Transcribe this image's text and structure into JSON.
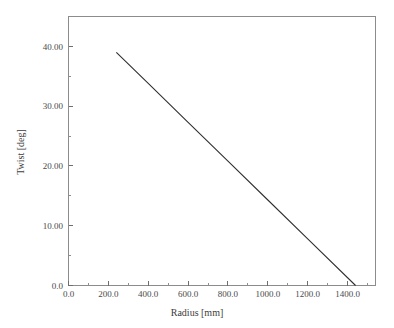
{
  "chart_data": {
    "type": "line",
    "title": "",
    "xlabel": "Radius [mm]",
    "ylabel": "Twist [deg]",
    "xlim": [
      0,
      1540
    ],
    "ylim": [
      0,
      45
    ],
    "grid": false,
    "legend": "none",
    "line_color": "#2f2f2f",
    "frame_color": "#8c8c8c",
    "x_ticks": [
      {
        "value": 0,
        "label": "0.0"
      },
      {
        "value": 200,
        "label": "200.0"
      },
      {
        "value": 400,
        "label": "400.0"
      },
      {
        "value": 600,
        "label": "600.0"
      },
      {
        "value": 800,
        "label": "800.0"
      },
      {
        "value": 1000,
        "label": "1000.0"
      },
      {
        "value": 1200,
        "label": "1200.0"
      },
      {
        "value": 1400,
        "label": "1400.0"
      }
    ],
    "x_minor_ticks": [
      100,
      300,
      500,
      700,
      900,
      1100,
      1300,
      1500
    ],
    "y_ticks": [
      {
        "value": 0,
        "label": "0.0"
      },
      {
        "value": 10,
        "label": "10.00"
      },
      {
        "value": 20,
        "label": "20.00"
      },
      {
        "value": 30,
        "label": "30.00"
      },
      {
        "value": 40,
        "label": "40.00"
      }
    ],
    "y_minor_ticks": [
      5,
      15,
      25,
      35,
      45
    ],
    "series": [
      {
        "name": "Twist distribution",
        "x": [
          240,
          1440
        ],
        "values": [
          39.0,
          0.0
        ],
        "points": [
          {
            "x": 240,
            "y": 39.0
          },
          {
            "x": 400,
            "y": 33.8
          },
          {
            "x": 600,
            "y": 27.3
          },
          {
            "x": 800,
            "y": 20.8
          },
          {
            "x": 1000,
            "y": 14.3
          },
          {
            "x": 1200,
            "y": 7.8
          },
          {
            "x": 1440,
            "y": 0.0
          }
        ]
      }
    ]
  }
}
